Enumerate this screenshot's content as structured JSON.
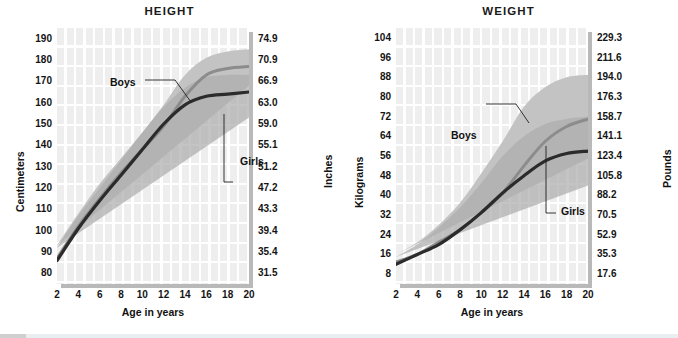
{
  "charts": [
    {
      "title": "HEIGHT",
      "y_left_title": "Centimeters",
      "y_right_title": "Inches",
      "x_title": "Age in years",
      "y_left_ticks": [
        "190",
        "180",
        "170",
        "160",
        "150",
        "140",
        "130",
        "120",
        "110",
        "100",
        "90",
        "80"
      ],
      "y_right_ticks": [
        "74.9",
        "70.9",
        "66.9",
        "63.0",
        "59.0",
        "55.1",
        "51.2",
        "47.2",
        "43.3",
        "39.4",
        "35.4",
        "31.5"
      ],
      "x_ticks": [
        "2",
        "4",
        "6",
        "8",
        "10",
        "12",
        "14",
        "16",
        "18",
        "20"
      ],
      "series_labels": {
        "boys": "Boys",
        "girls": "Girls"
      }
    },
    {
      "title": "WEIGHT",
      "y_left_title": "Kilograms",
      "y_right_title": "Pounds",
      "x_title": "Age in years",
      "y_left_ticks": [
        "104",
        "96",
        "88",
        "80",
        "72",
        "64",
        "56",
        "48",
        "40",
        "32",
        "24",
        "16",
        "8"
      ],
      "y_right_ticks": [
        "229.3",
        "211.6",
        "194.0",
        "176.3",
        "158.7",
        "141.1",
        "123.4",
        "105.8",
        "88.2",
        "70.5",
        "52.9",
        "35.3",
        "17.6"
      ],
      "x_ticks": [
        "2",
        "4",
        "6",
        "8",
        "10",
        "12",
        "14",
        "16",
        "18",
        "20"
      ],
      "series_labels": {
        "boys": "Boys",
        "girls": "Girls"
      }
    }
  ],
  "colors": {
    "boys_line": "#8c8c8c",
    "girls_line": "#2b2b2b",
    "boys_band": "#c3c3c3",
    "girls_band": "#adadad",
    "plot_bg": "#eeeeee",
    "grid_line": "#ffffff",
    "shadow": "#b9b9b9",
    "text": "#141414"
  },
  "chart_data": [
    {
      "type": "line",
      "title": "HEIGHT",
      "xlabel": "Age in years",
      "ylabel": "Centimeters",
      "ylabel_secondary": "Inches",
      "xlim": [
        2,
        20
      ],
      "ylim": [
        75,
        195
      ],
      "ylim_secondary": [
        29.5,
        76.8
      ],
      "grid": true,
      "legend": "inline-annotation",
      "x": [
        2,
        4,
        6,
        8,
        10,
        12,
        14,
        16,
        18,
        20
      ],
      "series": [
        {
          "name": "Boys",
          "values": [
            87,
            102,
            115,
            127,
            138,
            149,
            163,
            173,
            176,
            177
          ],
          "band_low": [
            81,
            96,
            109,
            120,
            130,
            140,
            153,
            163,
            167,
            168
          ],
          "band_high": [
            93,
            108,
            122,
            134,
            146,
            159,
            173,
            181,
            184,
            185
          ]
        },
        {
          "name": "Girls",
          "values": [
            86,
            101,
            114,
            126,
            138,
            150,
            159,
            163,
            164,
            165
          ],
          "band_low": [
            80,
            95,
            107,
            118,
            129,
            141,
            150,
            153,
            153,
            153
          ],
          "band_high": [
            92,
            107,
            120,
            133,
            146,
            158,
            167,
            172,
            173,
            173
          ]
        }
      ]
    },
    {
      "type": "line",
      "title": "WEIGHT",
      "xlabel": "Age in years",
      "ylabel": "Kilograms",
      "ylabel_secondary": "Pounds",
      "xlim": [
        2,
        20
      ],
      "ylim": [
        4,
        108
      ],
      "ylim_secondary": [
        8.8,
        238
      ],
      "grid": true,
      "legend": "inline-annotation",
      "x": [
        2,
        4,
        6,
        8,
        10,
        12,
        14,
        16,
        18,
        20
      ],
      "series": [
        {
          "name": "Boys",
          "values": [
            13,
            16,
            21,
            26,
            33,
            41,
            52,
            62,
            68,
            71
          ],
          "band_low": [
            10,
            13,
            16,
            19,
            23,
            29,
            38,
            47,
            52,
            55
          ],
          "band_high": [
            16,
            21,
            28,
            37,
            49,
            62,
            76,
            84,
            88,
            89
          ]
        },
        {
          "name": "Girls",
          "values": [
            12,
            16,
            20,
            26,
            33,
            41,
            48,
            54,
            57,
            58
          ],
          "band_low": [
            10,
            13,
            16,
            20,
            25,
            31,
            37,
            41,
            43,
            44
          ],
          "band_high": [
            15,
            20,
            27,
            35,
            45,
            56,
            64,
            69,
            71,
            72
          ]
        }
      ]
    }
  ]
}
